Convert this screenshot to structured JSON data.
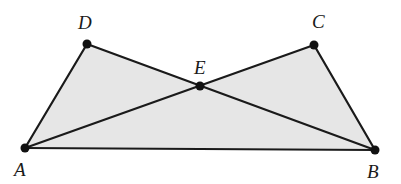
{
  "diagram": {
    "type": "geometry",
    "colors": {
      "line": "#1a1a1a",
      "shade": "#e6e6e6",
      "point": "#111111"
    },
    "points": {
      "A": {
        "label": "A",
        "x": 25,
        "y": 148,
        "label_x": 14,
        "label_y": 176
      },
      "B": {
        "label": "B",
        "x": 375,
        "y": 150,
        "label_x": 367,
        "label_y": 178
      },
      "C": {
        "label": "C",
        "x": 314,
        "y": 45,
        "label_x": 312,
        "label_y": 28
      },
      "D": {
        "label": "D",
        "x": 87,
        "y": 44,
        "label_x": 78,
        "label_y": 29
      },
      "E": {
        "label": "E",
        "x": 200,
        "y": 86,
        "label_x": 194,
        "label_y": 74
      }
    },
    "segments": [
      [
        "A",
        "D"
      ],
      [
        "D",
        "B"
      ],
      [
        "A",
        "C"
      ],
      [
        "C",
        "B"
      ],
      [
        "A",
        "B"
      ]
    ],
    "shaded_regions": [
      [
        "A",
        "D",
        "E",
        "C",
        "B"
      ]
    ]
  }
}
